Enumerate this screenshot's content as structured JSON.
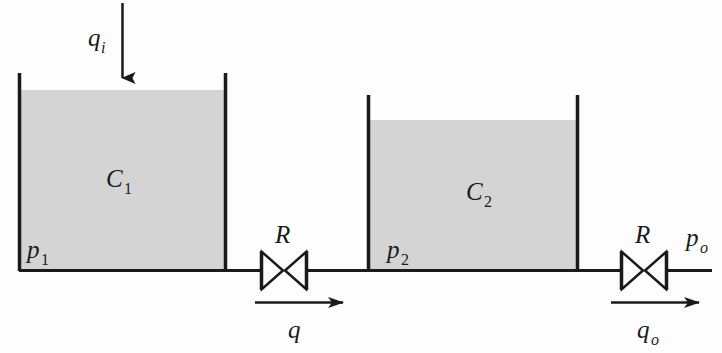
{
  "figure": {
    "background_color": "#fdfdfd",
    "line_color": "#1a1a1a",
    "fill_color": "#d4d4d4"
  },
  "labels": {
    "inlet_flow": {
      "symbol": "q",
      "subscript": "i",
      "text": "qi"
    },
    "capacitance_1": {
      "symbol": "C",
      "subscript": "1",
      "text": "C1"
    },
    "capacitance_2": {
      "symbol": "C",
      "subscript": "2",
      "text": "C2"
    },
    "pressure_1": {
      "symbol": "p",
      "subscript": "1",
      "text": "p1"
    },
    "pressure_2": {
      "symbol": "p",
      "subscript": "2",
      "text": "p2"
    },
    "pressure_out": {
      "symbol": "p",
      "subscript": "o",
      "text": "po"
    },
    "resistance_1": {
      "symbol": "R",
      "subscript": "",
      "text": "R"
    },
    "resistance_2": {
      "symbol": "R",
      "subscript": "",
      "text": "R"
    },
    "mid_flow": {
      "symbol": "q",
      "subscript": "",
      "text": "q"
    },
    "outlet_flow": {
      "symbol": "q",
      "subscript": "o",
      "text": "qo"
    }
  },
  "components": [
    {
      "name": "tank-1",
      "type": "tank",
      "capacitance": "C1",
      "pressure": "p1"
    },
    {
      "name": "valve-1",
      "type": "resistance-valve",
      "resistance": "R"
    },
    {
      "name": "tank-2",
      "type": "tank",
      "capacitance": "C2",
      "pressure": "p2"
    },
    {
      "name": "valve-2",
      "type": "resistance-valve",
      "resistance": "R"
    }
  ],
  "flows": [
    {
      "name": "inlet",
      "label": "qi",
      "direction": "down"
    },
    {
      "name": "intermediate",
      "label": "q",
      "direction": "right"
    },
    {
      "name": "outlet",
      "label": "qo",
      "direction": "right"
    }
  ]
}
